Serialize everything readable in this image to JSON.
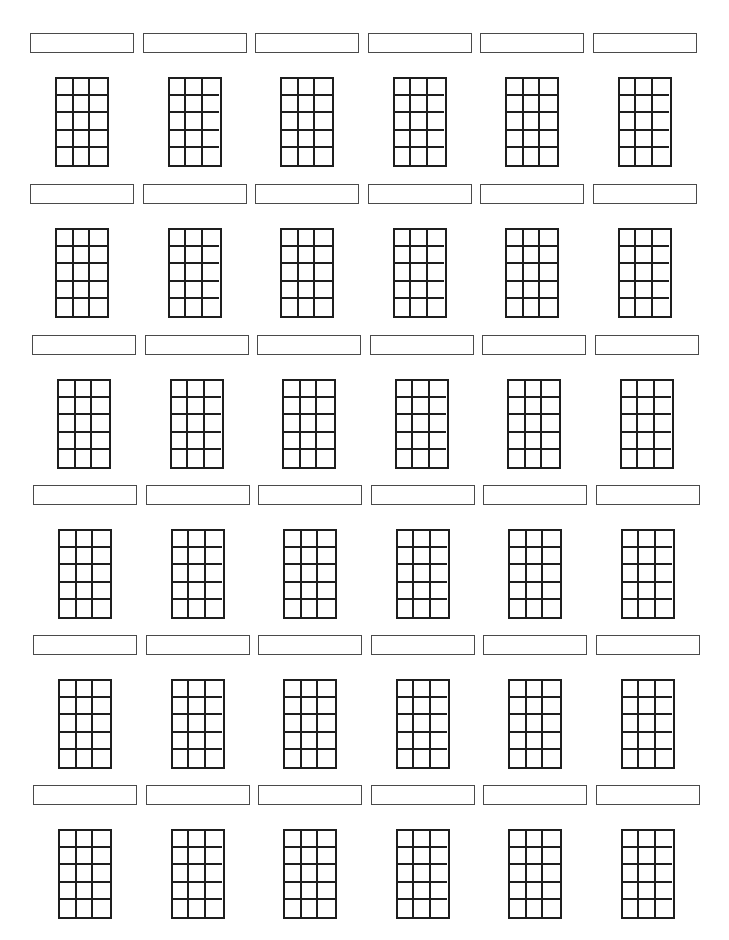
{
  "worksheet": {
    "type": "blank chord diagram sheet",
    "rows": 6,
    "columns": 6,
    "diagram": {
      "strings_columns": 3,
      "fret_rows": 5
    },
    "line_color": "#1e1e1e",
    "box_border_color": "#4a4a4a",
    "background": "#ffffff",
    "layout": {
      "column_spacing": 112.5,
      "row_origins": [
        {
          "x": 30,
          "y": 33
        },
        {
          "x": 30,
          "y": 184
        },
        {
          "x": 32,
          "y": 335
        },
        {
          "x": 33,
          "y": 485
        },
        {
          "x": 33,
          "y": 635
        },
        {
          "x": 33,
          "y": 785
        }
      ]
    },
    "chord_names": [
      [
        "",
        "",
        "",
        "",
        "",
        ""
      ],
      [
        "",
        "",
        "",
        "",
        "",
        ""
      ],
      [
        "",
        "",
        "",
        "",
        "",
        ""
      ],
      [
        "",
        "",
        "",
        "",
        "",
        ""
      ],
      [
        "",
        "",
        "",
        "",
        "",
        ""
      ],
      [
        "",
        "",
        "",
        "",
        "",
        ""
      ]
    ]
  }
}
